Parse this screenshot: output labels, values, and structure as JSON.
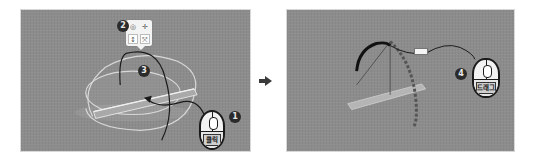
{
  "diagram": {
    "type": "instructional-steps",
    "colors": {
      "background": "#ffffff",
      "viewport": "#8c8c8c",
      "badge": "#2b2b2b",
      "gizmo_ring": "#d9d9d9",
      "rotation_arc": "#1a1a1a"
    }
  },
  "left_panel": {
    "steps": [
      {
        "number": "1",
        "label": "❶"
      },
      {
        "number": "2",
        "label": "❷"
      },
      {
        "number": "3",
        "label": "❸"
      }
    ],
    "mouse": {
      "button_label": "클릭"
    },
    "toolbar": {
      "buttons": [
        {
          "name": "rotate",
          "glyph": "◎"
        },
        {
          "name": "move",
          "glyph": "✛"
        },
        {
          "name": "scale-vertical",
          "glyph": "↕"
        },
        {
          "name": "scale-all",
          "glyph": "⤧"
        }
      ]
    }
  },
  "transition": {
    "arrow_glyph": "➡"
  },
  "right_panel": {
    "steps": [
      {
        "number": "4",
        "label": "❹"
      }
    ],
    "mouse": {
      "button_label": "드래그"
    },
    "drag_direction": "up"
  }
}
